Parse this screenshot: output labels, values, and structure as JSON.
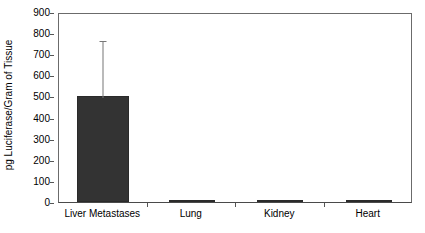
{
  "chart_data": {
    "type": "bar",
    "title": "",
    "xlabel": "",
    "ylabel": "pg Luciferase/Gram of Tissue",
    "categories": [
      "Liver Metastases",
      "Lung",
      "Kidney",
      "Heart"
    ],
    "values": [
      500,
      4,
      2,
      6
    ],
    "errors_upper": [
      270,
      0,
      0,
      0
    ],
    "series": [
      {
        "name": "pg Luciferase/Gram of Tissue",
        "values": [
          500,
          4,
          2,
          6
        ]
      }
    ],
    "ylim": [
      0,
      900
    ],
    "ytick_labels": [
      "0",
      "100",
      "200",
      "300",
      "400",
      "500",
      "600",
      "700",
      "800",
      "900"
    ],
    "ytick_values": [
      0,
      100,
      200,
      300,
      400,
      500,
      600,
      700,
      800,
      900
    ],
    "grid": false,
    "legend": "none",
    "bar_color": "#333333",
    "error_bar_color": "#777777",
    "axis_color": "#6b6b6b",
    "background_color": "#ffffff",
    "annotations": [
      "Liver Metastases bar reaches approximately 500 with an upper error bar to about 770",
      "Lung, Kidney and Heart bars are near zero"
    ]
  }
}
